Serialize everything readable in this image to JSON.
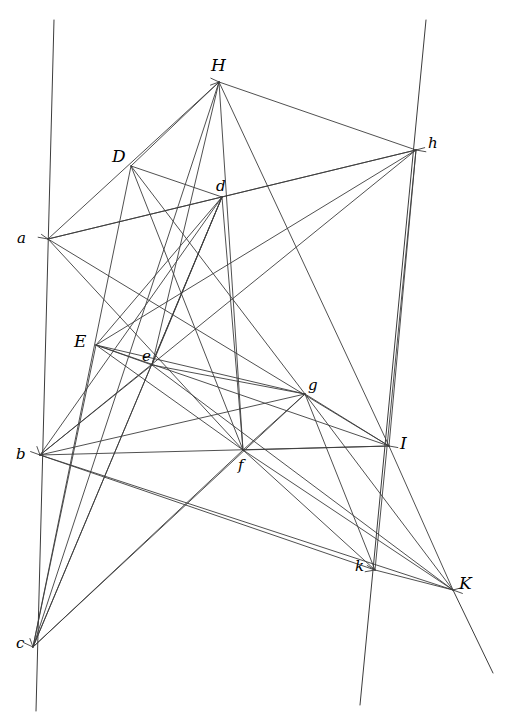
{
  "figure": {
    "background_color": "#ffffff",
    "line_color": "#3c3c3c",
    "label_color": "#000000",
    "width": 510,
    "height": 726,
    "points": [
      {
        "id": "H",
        "label": "H",
        "x": 219,
        "y": 82,
        "case": "upper",
        "lx": 211,
        "ly": 57
      },
      {
        "id": "h",
        "label": "h",
        "x": 416,
        "y": 150,
        "case": "lower",
        "lx": 428,
        "ly": 136
      },
      {
        "id": "D",
        "label": "D",
        "x": 131,
        "y": 166,
        "case": "upper",
        "lx": 112,
        "ly": 148
      },
      {
        "id": "d",
        "label": "d",
        "x": 222,
        "y": 197,
        "case": "lower",
        "lx": 216,
        "ly": 179
      },
      {
        "id": "a",
        "label": "a",
        "x": 48,
        "y": 239,
        "case": "lower",
        "lx": 17,
        "ly": 231
      },
      {
        "id": "E",
        "label": "E",
        "x": 96,
        "y": 345,
        "case": "upper",
        "lx": 74,
        "ly": 333
      },
      {
        "id": "e",
        "label": "e",
        "x": 152,
        "y": 365,
        "case": "lower",
        "lx": 142,
        "ly": 349
      },
      {
        "id": "g",
        "label": "g",
        "x": 305,
        "y": 394,
        "case": "lower",
        "lx": 308,
        "ly": 378
      },
      {
        "id": "b",
        "label": "b",
        "x": 40,
        "y": 455,
        "case": "lower",
        "lx": 16,
        "ly": 447
      },
      {
        "id": "f",
        "label": "f",
        "x": 243,
        "y": 450,
        "case": "lower",
        "lx": 238,
        "ly": 458
      },
      {
        "id": "I",
        "label": "I",
        "x": 389,
        "y": 446,
        "case": "upper",
        "lx": 400,
        "ly": 435
      },
      {
        "id": "k",
        "label": "k",
        "x": 375,
        "y": 570,
        "case": "lower",
        "lx": 355,
        "ly": 559
      },
      {
        "id": "K",
        "label": "K",
        "x": 453,
        "y": 590,
        "case": "upper",
        "lx": 459,
        "ly": 575
      },
      {
        "id": "c",
        "label": "c",
        "x": 33,
        "y": 647,
        "case": "lower",
        "lx": 16,
        "ly": 636
      }
    ],
    "transversals": [
      {
        "id": "left-transversal",
        "x1": 54,
        "y1": 20,
        "x2": 36,
        "y2": 711
      },
      {
        "id": "right-transversal",
        "x1": 426,
        "y1": 20,
        "x2": 360,
        "y2": 705
      }
    ],
    "long_rays": [
      {
        "id": "ray-K-extended",
        "x1": 453,
        "y1": 590,
        "x2": 493,
        "y2": 673
      }
    ],
    "segments": [
      {
        "from": "a",
        "to": "H"
      },
      {
        "from": "a",
        "to": "d"
      },
      {
        "from": "a",
        "to": "h"
      },
      {
        "from": "a",
        "to": "f"
      },
      {
        "from": "a",
        "to": "I"
      },
      {
        "from": "D",
        "to": "H"
      },
      {
        "from": "D",
        "to": "d"
      },
      {
        "from": "D",
        "to": "f"
      },
      {
        "from": "D",
        "to": "g"
      },
      {
        "from": "D",
        "to": "c"
      },
      {
        "from": "H",
        "to": "h"
      },
      {
        "from": "H",
        "to": "e"
      },
      {
        "from": "H",
        "to": "f"
      },
      {
        "from": "H",
        "to": "c"
      },
      {
        "from": "d",
        "to": "h"
      },
      {
        "from": "d",
        "to": "e"
      },
      {
        "from": "d",
        "to": "f"
      },
      {
        "from": "d",
        "to": "c"
      },
      {
        "from": "E",
        "to": "e"
      },
      {
        "from": "E",
        "to": "d"
      },
      {
        "from": "E",
        "to": "g"
      },
      {
        "from": "E",
        "to": "f"
      },
      {
        "from": "E",
        "to": "c"
      },
      {
        "from": "e",
        "to": "g"
      },
      {
        "from": "e",
        "to": "b"
      },
      {
        "from": "e",
        "to": "K"
      },
      {
        "from": "b",
        "to": "g"
      },
      {
        "from": "b",
        "to": "I"
      },
      {
        "from": "b",
        "to": "h"
      },
      {
        "from": "b",
        "to": "d"
      },
      {
        "from": "b",
        "to": "K"
      },
      {
        "from": "b",
        "to": "k"
      },
      {
        "from": "g",
        "to": "I"
      },
      {
        "from": "g",
        "to": "f"
      },
      {
        "from": "g",
        "to": "k"
      },
      {
        "from": "g",
        "to": "K"
      },
      {
        "from": "f",
        "to": "I"
      },
      {
        "from": "f",
        "to": "c"
      },
      {
        "from": "f",
        "to": "K"
      },
      {
        "from": "f",
        "to": "k"
      },
      {
        "from": "I",
        "to": "h"
      },
      {
        "from": "I",
        "to": "K"
      },
      {
        "from": "I",
        "to": "H"
      },
      {
        "from": "k",
        "to": "K"
      },
      {
        "from": "h",
        "to": "k"
      },
      {
        "from": "h",
        "to": "E"
      },
      {
        "from": "c",
        "to": "g"
      },
      {
        "from": "c",
        "to": "d"
      },
      {
        "from": "E",
        "to": "I"
      }
    ],
    "tick_marks": [
      {
        "at": "H",
        "angle_deg": 205,
        "len": 9
      },
      {
        "at": "H",
        "angle_deg": 160,
        "len": 9
      },
      {
        "at": "h",
        "angle_deg": 10,
        "len": 10
      },
      {
        "at": "h",
        "angle_deg": 345,
        "len": 9
      },
      {
        "at": "a",
        "angle_deg": 190,
        "len": 10
      },
      {
        "at": "a",
        "angle_deg": 215,
        "len": 8
      },
      {
        "at": "b",
        "angle_deg": 200,
        "len": 10
      },
      {
        "at": "b",
        "angle_deg": 250,
        "len": 9
      },
      {
        "at": "c",
        "angle_deg": 205,
        "len": 10
      },
      {
        "at": "c",
        "angle_deg": 250,
        "len": 9
      },
      {
        "at": "k",
        "angle_deg": 170,
        "len": 10
      },
      {
        "at": "k",
        "angle_deg": 210,
        "len": 9
      },
      {
        "at": "K",
        "angle_deg": 20,
        "len": 10
      },
      {
        "at": "K",
        "angle_deg": 345,
        "len": 9
      },
      {
        "at": "I",
        "angle_deg": 10,
        "len": 9
      }
    ]
  }
}
